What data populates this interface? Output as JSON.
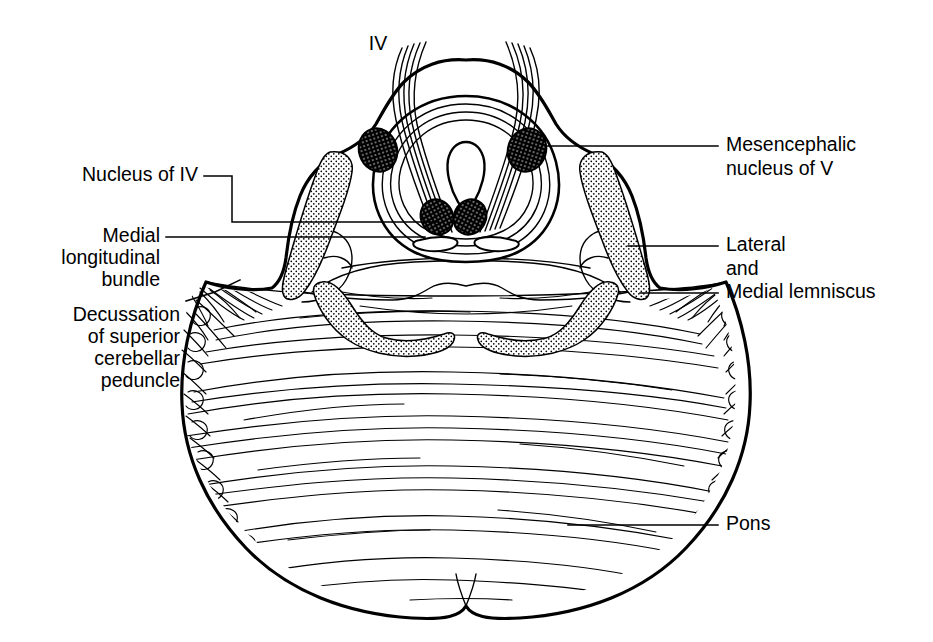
{
  "figure": {
    "background_color": "#ffffff",
    "ink_color": "#000000",
    "width": 933,
    "height": 642
  },
  "labels": {
    "nerve_iv": "IV",
    "nucleus_of_iv": "Nucleus of IV",
    "mlf_line1": "Medial",
    "mlf_line2": "longitudinal",
    "mlf_line3": "bundle",
    "decussation_line1": "Decussation",
    "decussation_line2": "of superior",
    "decussation_line3": "cerebellar",
    "decussation_line4": "peduncle",
    "mesencephalic_line1": "Mesencephalic",
    "mesencephalic_line2": "nucleus of V",
    "lemniscus_line1": "Lateral",
    "lemniscus_line2": "and",
    "lemniscus_line3": "Medial lemniscus",
    "pons": "Pons"
  },
  "structures": [
    {
      "name": "trochlear-nerve-decussation",
      "side": "midline-dorsal"
    },
    {
      "name": "cerebral-aqueduct",
      "side": "midline"
    },
    {
      "name": "periaqueductal-grey-ring",
      "side": "midline"
    },
    {
      "name": "mesencephalic-nucleus-of-v-left",
      "side": "left"
    },
    {
      "name": "mesencephalic-nucleus-of-v-right",
      "side": "right"
    },
    {
      "name": "trochlear-nucleus-left",
      "side": "left"
    },
    {
      "name": "trochlear-nucleus-right",
      "side": "right"
    },
    {
      "name": "medial-longitudinal-bundle-left",
      "side": "left"
    },
    {
      "name": "medial-longitudinal-bundle-right",
      "side": "right"
    },
    {
      "name": "superior-cerebellar-peduncle-left",
      "side": "left"
    },
    {
      "name": "superior-cerebellar-peduncle-right",
      "side": "right"
    },
    {
      "name": "lateral-and-medial-lemniscus-left",
      "side": "left"
    },
    {
      "name": "lateral-and-medial-lemniscus-right",
      "side": "right"
    },
    {
      "name": "decussation-of-superior-cerebellar-peduncle",
      "side": "bilateral"
    },
    {
      "name": "basilar-pons",
      "side": "ventral"
    },
    {
      "name": "transverse-pontine-fibres",
      "side": "ventral"
    }
  ]
}
